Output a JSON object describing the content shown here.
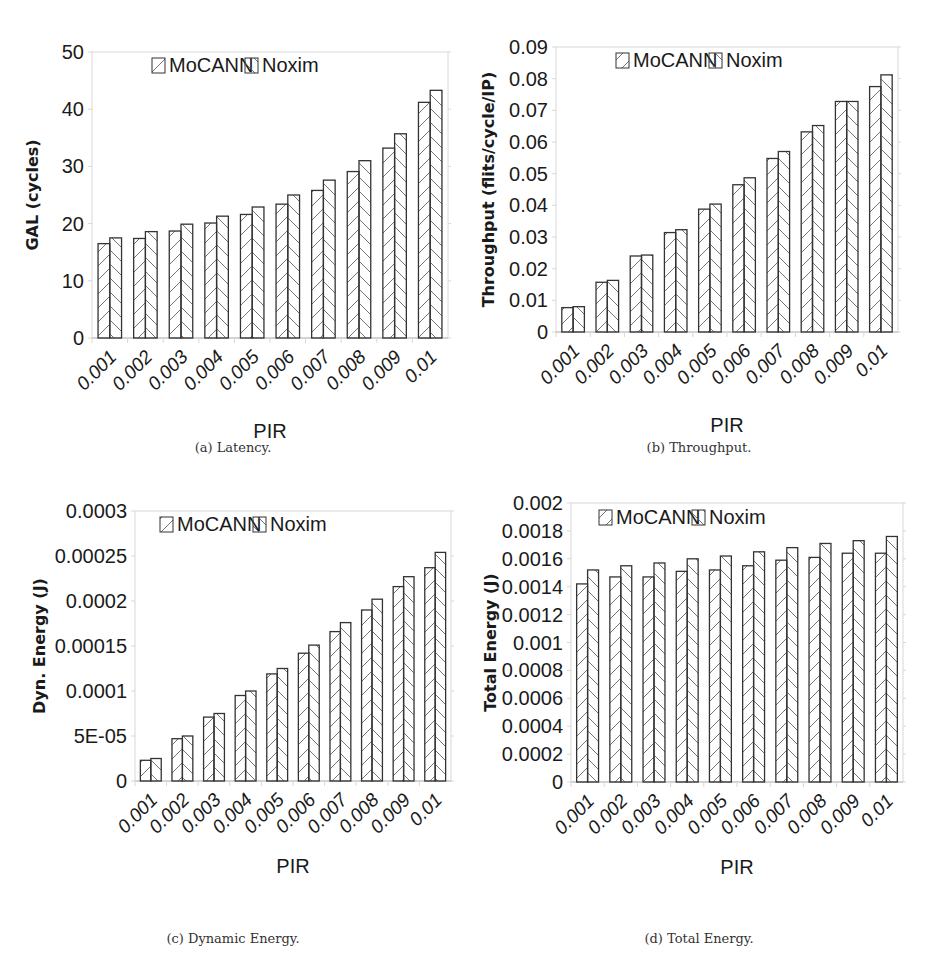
{
  "figure": {
    "captions": [
      "(a) Latency.",
      "(b) Throughput.",
      "(c) Dynamic Energy.",
      "(d) Total Energy."
    ]
  },
  "legend": {
    "series": [
      {
        "name": "MoCANN",
        "hatch": "forward-slash"
      },
      {
        "name": "Noxim",
        "hatch": "back-slash"
      }
    ]
  },
  "colors": {
    "bar_stroke": "#333333",
    "hatch": "#666666",
    "grid": "#d8d8d8",
    "text": "#1a1a1a"
  },
  "chart_data": [
    {
      "id": "a",
      "type": "bar",
      "title": "(a) Latency.",
      "xlabel": "PIR",
      "ylabel": "GAL (cycles)",
      "categories": [
        "0.001",
        "0.002",
        "0.003",
        "0.004",
        "0.005",
        "0.006",
        "0.007",
        "0.008",
        "0.009",
        "0.01"
      ],
      "ylim": [
        0,
        50
      ],
      "yticks": [
        "0",
        "10",
        "20",
        "30",
        "40",
        "50"
      ],
      "ytick_values": [
        0,
        10,
        20,
        30,
        40,
        50
      ],
      "legend_position": "top-center-inside",
      "grid": false,
      "series": [
        {
          "name": "MoCANN",
          "values": [
            16.5,
            17.4,
            18.7,
            20.1,
            21.6,
            23.4,
            25.8,
            29.1,
            33.2,
            41.2
          ]
        },
        {
          "name": "Noxim",
          "values": [
            17.5,
            18.6,
            19.9,
            21.3,
            22.9,
            25.0,
            27.6,
            31.0,
            35.7,
            43.3
          ]
        }
      ]
    },
    {
      "id": "b",
      "type": "bar",
      "title": "(b) Throughput.",
      "xlabel": "PIR",
      "ylabel": "Throughput (flits/cycle/IP)",
      "categories": [
        "0.001",
        "0.002",
        "0.003",
        "0.004",
        "0.005",
        "0.006",
        "0.007",
        "0.008",
        "0.009",
        "0.01"
      ],
      "ylim": [
        0,
        0.09
      ],
      "yticks": [
        "0",
        "0.01",
        "0.02",
        "0.03",
        "0.04",
        "0.05",
        "0.06",
        "0.07",
        "0.08",
        "0.09"
      ],
      "ytick_values": [
        0,
        0.01,
        0.02,
        0.03,
        0.04,
        0.05,
        0.06,
        0.07,
        0.08,
        0.09
      ],
      "legend_position": "top-center-inside",
      "grid": false,
      "series": [
        {
          "name": "MoCANN",
          "values": [
            0.0077,
            0.0157,
            0.024,
            0.0314,
            0.0388,
            0.0465,
            0.0548,
            0.0632,
            0.0728,
            0.0775
          ]
        },
        {
          "name": "Noxim",
          "values": [
            0.008,
            0.0163,
            0.0243,
            0.0323,
            0.0404,
            0.0487,
            0.057,
            0.0652,
            0.0728,
            0.0812
          ]
        }
      ]
    },
    {
      "id": "c",
      "type": "bar",
      "title": "(c) Dynamic Energy.",
      "xlabel": "PIR",
      "ylabel": "Dyn. Energy (J)",
      "categories": [
        "0.001",
        "0.002",
        "0.003",
        "0.004",
        "0.005",
        "0.006",
        "0.007",
        "0.008",
        "0.009",
        "0.01"
      ],
      "ylim": [
        0,
        0.0003
      ],
      "yticks": [
        "0",
        "5E-05",
        "0.0001",
        "0.00015",
        "0.0002",
        "0.00025",
        "0.0003"
      ],
      "ytick_values": [
        0,
        5e-05,
        0.0001,
        0.00015,
        0.0002,
        0.00025,
        0.0003
      ],
      "legend_position": "top-center-inside",
      "grid": false,
      "series": [
        {
          "name": "MoCANN",
          "values": [
            2.3e-05,
            4.7e-05,
            7.1e-05,
            9.5e-05,
            0.000119,
            0.000142,
            0.000166,
            0.00019,
            0.000216,
            0.000237
          ]
        },
        {
          "name": "Noxim",
          "values": [
            2.5e-05,
            5e-05,
            7.5e-05,
            0.0001,
            0.000125,
            0.000151,
            0.000176,
            0.000202,
            0.000227,
            0.000254
          ]
        }
      ]
    },
    {
      "id": "d",
      "type": "bar",
      "title": "(d) Total Energy.",
      "xlabel": "PIR",
      "ylabel": "Total Energy (J)",
      "categories": [
        "0.001",
        "0.002",
        "0.003",
        "0.004",
        "0.005",
        "0.006",
        "0.007",
        "0.008",
        "0.009",
        "0.01"
      ],
      "ylim": [
        0,
        0.002
      ],
      "yticks": [
        "0",
        "0.0002",
        "0.0004",
        "0.0006",
        "0.0008",
        "0.001",
        "0.0012",
        "0.0014",
        "0.0016",
        "0.0018",
        "0.002"
      ],
      "ytick_values": [
        0,
        0.0002,
        0.0004,
        0.0006,
        0.0008,
        0.001,
        0.0012,
        0.0014,
        0.0016,
        0.0018,
        0.002
      ],
      "legend_position": "top-center-inside",
      "grid": false,
      "series": [
        {
          "name": "MoCANN",
          "values": [
            0.00142,
            0.00147,
            0.00147,
            0.00151,
            0.00152,
            0.00155,
            0.00159,
            0.00161,
            0.00164,
            0.00164
          ]
        },
        {
          "name": "Noxim",
          "values": [
            0.00152,
            0.00155,
            0.00157,
            0.0016,
            0.00162,
            0.00165,
            0.00168,
            0.00171,
            0.00173,
            0.00176
          ]
        }
      ]
    }
  ]
}
